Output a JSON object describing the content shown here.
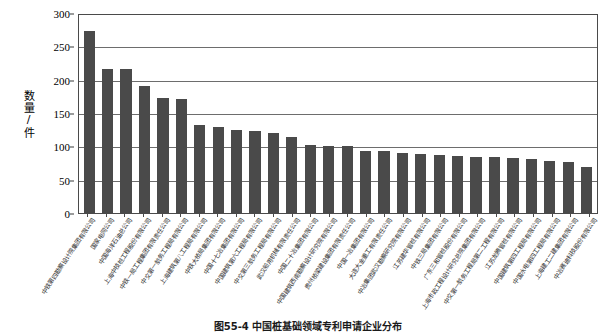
{
  "figure": {
    "caption": "图55-4  中国桩基础领域专利申请企业分布"
  },
  "chart_data": {
    "type": "bar",
    "title": "中国桩基础领域专利申请企业分布",
    "xlabel": "",
    "ylabel": "数量/件",
    "ylim": [
      0,
      300
    ],
    "yticks": [
      0,
      50,
      100,
      150,
      200,
      250,
      300
    ],
    "grid": true,
    "legend": "none",
    "bar_color": "#4a4a4a",
    "categories": [
      "中铁第四勘察设计院集团有限公司",
      "国家电网公司",
      "中国海洋石油总公司",
      "上海中技桩工程股份有限公司",
      "中铁一局工程集团有限责任公司",
      "中交第一航务工程局有限公司",
      "上海建筑第八工程局有限公司",
      "中铁大桥局集团有限公司",
      "中国十七冶集团有限公司",
      "中国建筑第六工程局有限公司",
      "中交第三航务工程局有限公司",
      "武汉船用机械有限责任公司",
      "中国二十冶集团有限公司",
      "中国建筑西南勘察设计研究院有限公司",
      "贵州桥梁建设集团有限责任公司",
      "中国一冶集团有限公司",
      "大连大金重工有限责任公司",
      "中冶集团武汉勘察研究院有限公司",
      "江苏建华管桩有限公司",
      "中铁三局集团有限公司",
      "广东三和管桩股份有限公司",
      "上海市政工程设计研究总院集团有限公司",
      "中交第一航务工程局第二工程有限公司",
      "江苏龙腾管桩有限公司",
      "中国建筑第四工程局有限公司",
      "中国水电第四工程局有限公司",
      "上海建工二建集团有限公司",
      "中冶赛迪科技股份有限公司"
    ],
    "values": [
      275,
      218,
      217,
      192,
      174,
      173,
      134,
      130,
      126,
      124,
      122,
      116,
      103,
      102,
      102,
      95,
      94,
      91,
      90,
      88,
      87,
      86,
      85,
      84,
      83,
      80,
      78,
      71
    ]
  }
}
